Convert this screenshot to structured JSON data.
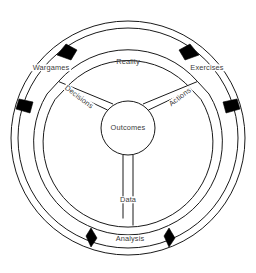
{
  "diagram": {
    "type": "cycle-wheel",
    "colors": {
      "stroke": "#1a1a1a",
      "arrow_fill": "#000000",
      "text": "#3b3b3b",
      "background": "#ffffff"
    },
    "hub": {
      "label": "Outcomes"
    },
    "outer_labels": [
      {
        "id": "wargames",
        "label": "Wargames"
      },
      {
        "id": "reality",
        "label": "Reality"
      },
      {
        "id": "exercises",
        "label": "Exercises"
      },
      {
        "id": "analysis",
        "label": "Analysis"
      }
    ],
    "spoke_labels": [
      {
        "id": "decisions",
        "label": "Decisions"
      },
      {
        "id": "actions",
        "label": "Actions"
      },
      {
        "id": "data",
        "label": "Data"
      }
    ],
    "arrowheads": [
      {
        "id": "arrow-outer-top-left",
        "direction": "counterclockwise"
      },
      {
        "id": "arrow-outer-top-right",
        "direction": "clockwise"
      },
      {
        "id": "arrow-outer-left",
        "direction": "downward"
      },
      {
        "id": "arrow-outer-right",
        "direction": "downward"
      },
      {
        "id": "arrow-outer-bottom-left",
        "direction": "leftward"
      },
      {
        "id": "arrow-outer-bottom-right",
        "direction": "leftward"
      }
    ]
  }
}
